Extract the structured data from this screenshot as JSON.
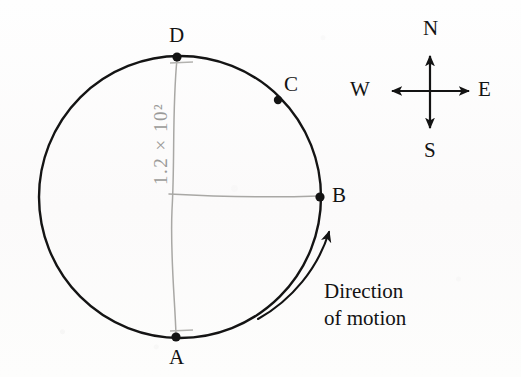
{
  "figure": {
    "background_color": "#fdfcfb",
    "ink_color": "#131313",
    "pencil_color": "#9a9a98"
  },
  "circle": {
    "center_x": 180,
    "center_y": 197,
    "radius": 141,
    "stroke_color": "#141414",
    "stroke_width": 2.4
  },
  "points": [
    {
      "id": "A",
      "label": "A",
      "dot_x": 176,
      "dot_y": 337,
      "label_x": 169,
      "label_y": 347
    },
    {
      "id": "B",
      "label": "B",
      "dot_x": 320,
      "dot_y": 197,
      "label_x": 332,
      "label_y": 185
    },
    {
      "id": "C",
      "label": "C",
      "dot_x": 278,
      "dot_y": 100,
      "label_x": 284,
      "label_y": 74
    },
    {
      "id": "D",
      "label": "D",
      "dot_x": 177,
      "dot_y": 57,
      "label_x": 169,
      "label_y": 25
    }
  ],
  "pencil_annotation": {
    "text": "1.2 × 10²",
    "rotation_deg": -90,
    "color": "#9a9a98"
  },
  "motion_arrow": {
    "caption_line_1": "Direction",
    "caption_line_2": "of motion",
    "caption_x": 324,
    "caption_y": 278,
    "arrow_tip_x": 330,
    "arrow_tip_y": 226,
    "arrow_tail_x": 258,
    "arrow_tail_y": 319,
    "rotation_sense": "counterclockwise-upward-along-right-arc"
  },
  "compass": {
    "center_x": 430,
    "center_y": 91,
    "arm_length_vertical": 38,
    "arm_length_horizontal": 40,
    "directions": [
      {
        "id": "north",
        "label": "N",
        "label_x": 423,
        "label_y": 18,
        "dx": 0,
        "dy": -1
      },
      {
        "id": "south",
        "label": "S",
        "label_x": 424,
        "label_y": 140,
        "dx": 0,
        "dy": 1
      },
      {
        "id": "east",
        "label": "E",
        "label_x": 478,
        "label_y": 79,
        "dx": 1,
        "dy": 0
      },
      {
        "id": "west",
        "label": "W",
        "label_x": 350,
        "label_y": 79,
        "dx": -1,
        "dy": 0
      }
    ]
  }
}
